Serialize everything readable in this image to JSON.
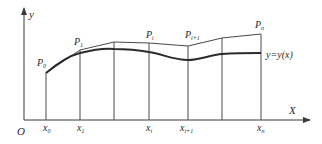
{
  "diagram": {
    "axes": {
      "origin_label": "O",
      "x_label": "X",
      "y_label": "y"
    },
    "curve_label": "y=y(x)",
    "points": [
      {
        "name": "P",
        "sub": "0",
        "x_label": "x",
        "x_sub": "0"
      },
      {
        "name": "P",
        "sub": "1",
        "x_label": "x",
        "x_sub": "1"
      },
      {
        "name": "",
        "sub": "",
        "x_label": "",
        "x_sub": ""
      },
      {
        "name": "P",
        "sub": "i",
        "x_label": "x",
        "x_sub": "i"
      },
      {
        "name": "P",
        "sub": "i+1",
        "x_label": "x",
        "x_sub": "i+1"
      },
      {
        "name": "",
        "sub": "",
        "x_label": "",
        "x_sub": ""
      },
      {
        "name": "P",
        "sub": "n",
        "x_label": "x",
        "x_sub": "n"
      }
    ],
    "colors": {
      "line": "#3a3a3a",
      "curve": "#2b2b2b",
      "text": "#2a2a2a"
    }
  }
}
